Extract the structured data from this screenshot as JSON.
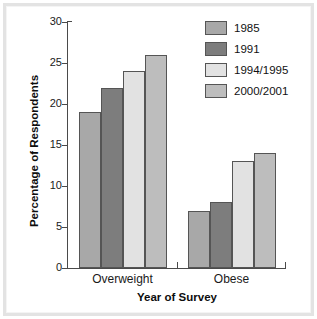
{
  "chart_data": {
    "type": "bar",
    "title": "",
    "subtitle": "",
    "xlabel": "Year of Survey",
    "ylabel": "Percentage of Respondents",
    "categories": [
      "Overweight",
      "Obese"
    ],
    "series": [
      {
        "name": "1985",
        "values": [
          19,
          7
        ],
        "color": "#a8a8a8"
      },
      {
        "name": "1991",
        "values": [
          22,
          8
        ],
        "color": "#7d7d7d"
      },
      {
        "name": "1994/1995",
        "values": [
          24,
          13
        ],
        "color": "#e2e2e2"
      },
      {
        "name": "2000/2001",
        "values": [
          26,
          14
        ],
        "color": "#bdbdbd"
      }
    ],
    "ylim": [
      0,
      30
    ],
    "yticks": [
      0,
      5,
      10,
      15,
      20,
      25,
      30
    ],
    "ytick_labels": [
      "0",
      "5",
      "10",
      "15",
      "20",
      "25",
      "30"
    ],
    "grid": false,
    "legend_position": "top-right",
    "bar_edge_color": "#555555"
  },
  "legend": {
    "entries": [
      {
        "label": "1985"
      },
      {
        "label": "1991"
      },
      {
        "label": "1994/1995"
      },
      {
        "label": "2000/2001"
      }
    ]
  },
  "axes": {
    "x_title": "Year of Survey",
    "y_title": "Percentage of Respondents",
    "x_tick_labels": [
      "Overweight",
      "Obese"
    ],
    "y_tick_labels": [
      "30",
      "25",
      "20",
      "15",
      "10",
      "5",
      "0"
    ]
  }
}
